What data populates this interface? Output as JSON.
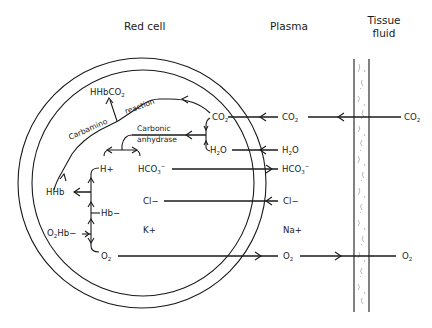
{
  "headers": {
    "red_cell": "Red cell",
    "plasma": "Plasma",
    "tissue_fluid_line1": "Tissue",
    "tissue_fluid_line2": "fluid"
  },
  "red_cell": {
    "hhbco2": {
      "main": "HHbCO",
      "sub": "2"
    },
    "carbamino": "Carbamino",
    "reaction": "reaction",
    "carbonic": "Carbonic",
    "anhydrase": "anhydrase",
    "co2": {
      "main": "CO",
      "sub": "2"
    },
    "h2o": {
      "pre": "H",
      "sub": "2",
      "post": "O"
    },
    "h_plus": "H+",
    "hco3": {
      "main": "HCO",
      "sub": "3",
      "sup": "−"
    },
    "hhb": "HHb",
    "hb_minus": "Hb−",
    "o2hb": {
      "pre": "O",
      "sub": "2",
      "post": "Hb−"
    },
    "cl_minus": "Cl−",
    "k_plus": "K+",
    "o2": {
      "main": "O",
      "sub": "2"
    }
  },
  "plasma": {
    "co2": {
      "main": "CO",
      "sub": "2"
    },
    "h2o": {
      "pre": "H",
      "sub": "2",
      "post": "O"
    },
    "hco3": {
      "main": "HCO",
      "sub": "3",
      "sup": "−"
    },
    "cl_minus": "Cl−",
    "na_plus": "Na+",
    "o2": {
      "main": "O",
      "sub": "2"
    }
  },
  "tissue_fluid": {
    "co2": {
      "main": "CO",
      "sub": "2"
    },
    "o2": {
      "main": "O",
      "sub": "2"
    }
  },
  "colors": {
    "ink": "#1a1a1a",
    "background": "#ffffff",
    "capillary_stipple": "#9a9a9a"
  }
}
